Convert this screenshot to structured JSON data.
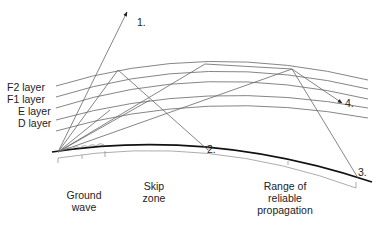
{
  "diagram": {
    "layers": [
      {
        "label": "F2 layer"
      },
      {
        "label": "F1 layer"
      },
      {
        "label": "E layer"
      },
      {
        "label": "D layer"
      }
    ],
    "ray_labels": {
      "r1": "1.",
      "r2": "2.",
      "r3": "3.",
      "r4": "4."
    },
    "zones": {
      "ground_wave_1": "Ground",
      "ground_wave_2": "wave",
      "skip_1": "Skip",
      "skip_2": "zone",
      "reliable_1": "Range of",
      "reliable_2": "reliable",
      "reliable_3": "propagation"
    },
    "colors": {
      "line": "#555555",
      "ground": "#111111",
      "text": "#222222"
    }
  }
}
